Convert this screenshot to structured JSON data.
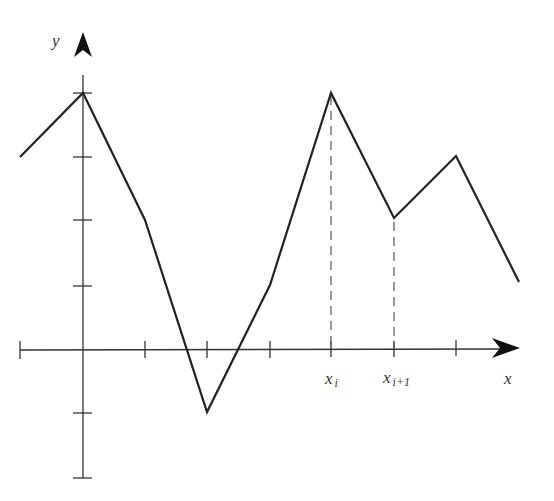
{
  "diagram": {
    "type": "piecewise-linear function plot",
    "axes": {
      "x_label": "x",
      "y_label": "y",
      "origin_px": [
        83,
        350
      ],
      "unit_px": 62.7,
      "x_ticks_units": [
        -1,
        1,
        2,
        3,
        4,
        5,
        6
      ],
      "y_ticks_units": [
        4,
        3,
        2,
        1,
        -1,
        -2
      ]
    },
    "tick_labels": {
      "xi": "x",
      "xi_sub": "i",
      "xi1": "x",
      "xi1_sub": "i+1"
    },
    "polyline_units": [
      [
        -1,
        3
      ],
      [
        0,
        4
      ],
      [
        1,
        2
      ],
      [
        2,
        -1
      ],
      [
        3,
        1
      ],
      [
        4,
        4
      ],
      [
        5,
        2
      ],
      [
        6,
        3
      ],
      [
        7,
        1
      ]
    ],
    "dashed_guides_units": [
      [
        4,
        4
      ],
      [
        5,
        2
      ]
    ],
    "colors": {
      "line": "#222222",
      "axis": "#333333",
      "dash": "#555555"
    }
  }
}
